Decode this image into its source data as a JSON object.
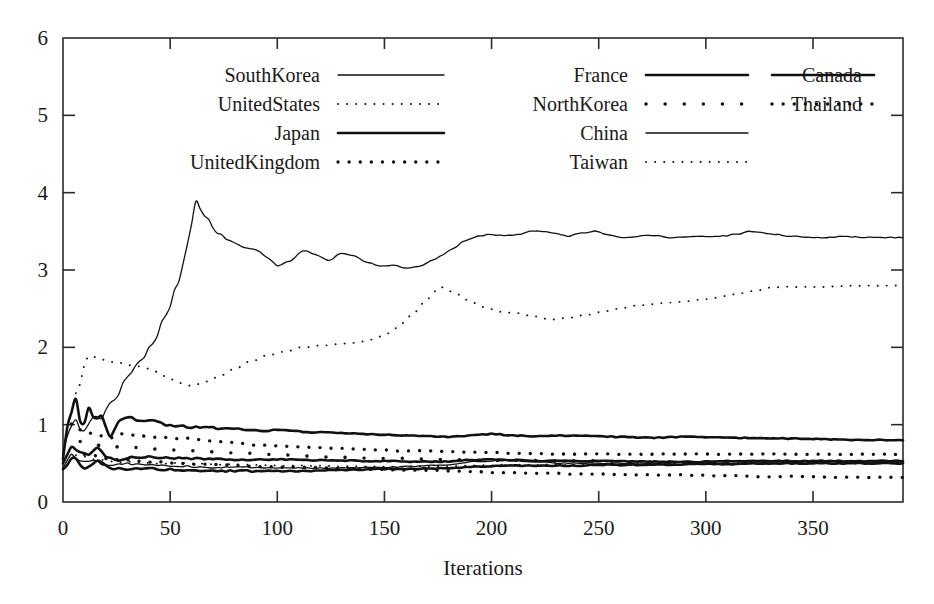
{
  "chart_data": {
    "type": "line",
    "title": "",
    "xlabel": "Iterations",
    "ylabel": "",
    "xlim": [
      0,
      392
    ],
    "ylim": [
      0,
      6
    ],
    "xticks": [
      0,
      50,
      100,
      150,
      200,
      250,
      300,
      350
    ],
    "yticks": [
      0,
      1,
      2,
      3,
      4,
      5,
      6
    ],
    "grid": false,
    "legend_position": "top-inside",
    "legend_columns": 3,
    "series": [
      {
        "name": "SouthKorea",
        "style": "solid-thin",
        "x": [
          0,
          3,
          6,
          9,
          12,
          15,
          18,
          21,
          24,
          30,
          36,
          42,
          48,
          54,
          58,
          62,
          66,
          72,
          78,
          84,
          90,
          96,
          100,
          106,
          112,
          118,
          124,
          130,
          136,
          142,
          148,
          154,
          160,
          166,
          172,
          176,
          182,
          188,
          194,
          200,
          206,
          212,
          218,
          224,
          230,
          236,
          242,
          248,
          254,
          260,
          266,
          272,
          278,
          284,
          290,
          296,
          302,
          308,
          314,
          320,
          326,
          332,
          338,
          344,
          350,
          356,
          362,
          368,
          374,
          380,
          386,
          392
        ],
        "values": [
          0.62,
          0.95,
          1.05,
          0.88,
          1.02,
          1.12,
          1.08,
          1.25,
          1.32,
          1.62,
          1.82,
          2.05,
          2.42,
          2.85,
          3.32,
          3.88,
          3.7,
          3.48,
          3.38,
          3.3,
          3.26,
          3.15,
          3.06,
          3.12,
          3.25,
          3.2,
          3.12,
          3.22,
          3.18,
          3.1,
          3.05,
          3.06,
          3.02,
          3.04,
          3.12,
          3.18,
          3.28,
          3.38,
          3.44,
          3.46,
          3.44,
          3.46,
          3.5,
          3.5,
          3.47,
          3.44,
          3.48,
          3.5,
          3.46,
          3.42,
          3.43,
          3.45,
          3.44,
          3.42,
          3.43,
          3.44,
          3.43,
          3.44,
          3.46,
          3.5,
          3.48,
          3.46,
          3.44,
          3.43,
          3.42,
          3.42,
          3.43,
          3.43,
          3.42,
          3.42,
          3.42,
          3.42
        ]
      },
      {
        "name": "UnitedStates",
        "style": "dotted-fine",
        "x": [
          6,
          12,
          18,
          24,
          30,
          36,
          42,
          48,
          54,
          60,
          66,
          72,
          80,
          88,
          96,
          104,
          112,
          120,
          128,
          136,
          144,
          152,
          158,
          164,
          170,
          176,
          182,
          188,
          196,
          204,
          212,
          220,
          228,
          236,
          244,
          252,
          260,
          268,
          276,
          284,
          292,
          300,
          308,
          316,
          324,
          332,
          340,
          348,
          356,
          364,
          372,
          380,
          388,
          392
        ],
        "values": [
          1.42,
          1.88,
          1.85,
          1.8,
          1.78,
          1.75,
          1.7,
          1.62,
          1.55,
          1.5,
          1.55,
          1.62,
          1.72,
          1.82,
          1.9,
          1.95,
          2.0,
          2.02,
          2.04,
          2.06,
          2.1,
          2.18,
          2.3,
          2.45,
          2.62,
          2.78,
          2.72,
          2.62,
          2.52,
          2.46,
          2.44,
          2.4,
          2.36,
          2.38,
          2.42,
          2.46,
          2.5,
          2.54,
          2.56,
          2.58,
          2.6,
          2.62,
          2.66,
          2.7,
          2.74,
          2.78,
          2.78,
          2.78,
          2.78,
          2.79,
          2.8,
          2.8,
          2.8,
          2.8
        ]
      },
      {
        "name": "Japan",
        "style": "solid-thick",
        "x": [
          0,
          3,
          6,
          9,
          12,
          15,
          18,
          22,
          26,
          30,
          36,
          42,
          48,
          54,
          60,
          68,
          76,
          84,
          92,
          100,
          108,
          116,
          124,
          132,
          140,
          150,
          160,
          170,
          180,
          190,
          200,
          210,
          220,
          230,
          240,
          250,
          262,
          274,
          286,
          298,
          310,
          322,
          334,
          346,
          358,
          370,
          382,
          392
        ],
        "values": [
          0.55,
          1.12,
          1.35,
          0.95,
          1.2,
          1.06,
          1.12,
          0.85,
          1.05,
          1.1,
          1.04,
          1.06,
          1.0,
          0.98,
          0.97,
          0.96,
          0.95,
          0.94,
          0.92,
          0.93,
          0.92,
          0.9,
          0.9,
          0.89,
          0.88,
          0.87,
          0.86,
          0.85,
          0.84,
          0.86,
          0.88,
          0.86,
          0.85,
          0.86,
          0.86,
          0.85,
          0.84,
          0.83,
          0.84,
          0.84,
          0.83,
          0.83,
          0.82,
          0.82,
          0.81,
          0.8,
          0.8,
          0.8
        ]
      },
      {
        "name": "UnitedKingdom",
        "style": "dotted-bold",
        "x": [
          4,
          10,
          16,
          22,
          28,
          34,
          42,
          50,
          58,
          66,
          74,
          82,
          90,
          98,
          106,
          114,
          122,
          130,
          140,
          150,
          160,
          170,
          180,
          190,
          200,
          210,
          220,
          230,
          240,
          252,
          264,
          276,
          288,
          300,
          312,
          324,
          336,
          348,
          360,
          372,
          384,
          392
        ],
        "values": [
          1.02,
          0.92,
          0.86,
          0.84,
          0.88,
          0.86,
          0.84,
          0.83,
          0.82,
          0.8,
          0.78,
          0.76,
          0.74,
          0.73,
          0.72,
          0.71,
          0.7,
          0.69,
          0.68,
          0.67,
          0.66,
          0.66,
          0.65,
          0.64,
          0.64,
          0.63,
          0.63,
          0.62,
          0.62,
          0.62,
          0.62,
          0.62,
          0.62,
          0.62,
          0.62,
          0.62,
          0.62,
          0.62,
          0.62,
          0.62,
          0.62,
          0.62
        ]
      },
      {
        "name": "France",
        "style": "solid-thick",
        "x": [
          0,
          4,
          8,
          12,
          16,
          20,
          26,
          32,
          40,
          50,
          60,
          70,
          80,
          92,
          104,
          116,
          128,
          140,
          152,
          164,
          176,
          188,
          200,
          212,
          224,
          236,
          248,
          260,
          272,
          284,
          296,
          308,
          320,
          332,
          344,
          356,
          368,
          380,
          392
        ],
        "values": [
          0.5,
          0.72,
          0.66,
          0.62,
          0.7,
          0.6,
          0.55,
          0.58,
          0.58,
          0.57,
          0.56,
          0.56,
          0.55,
          0.55,
          0.55,
          0.54,
          0.54,
          0.53,
          0.53,
          0.52,
          0.52,
          0.54,
          0.55,
          0.54,
          0.53,
          0.53,
          0.53,
          0.53,
          0.52,
          0.52,
          0.52,
          0.53,
          0.53,
          0.53,
          0.53,
          0.53,
          0.53,
          0.53,
          0.53
        ]
      },
      {
        "name": "NorthKorea",
        "style": "dotted-sparse",
        "x": [
          8,
          20,
          34,
          48,
          62,
          78,
          94,
          110,
          126,
          144,
          162,
          180,
          198,
          216,
          234,
          252,
          270,
          288,
          306,
          324,
          342,
          360,
          378,
          392
        ],
        "values": [
          0.78,
          0.72,
          0.7,
          0.68,
          0.66,
          0.64,
          0.62,
          0.6,
          0.58,
          0.57,
          0.56,
          0.55,
          0.54,
          0.54,
          0.53,
          0.53,
          0.52,
          0.52,
          0.52,
          0.52,
          0.52,
          0.52,
          0.52,
          0.52
        ]
      },
      {
        "name": "China",
        "style": "solid-thin",
        "x": [
          0,
          4,
          8,
          14,
          20,
          28,
          36,
          46,
          56,
          68,
          80,
          94,
          108,
          122,
          136,
          150,
          164,
          178,
          192,
          206,
          220,
          234,
          248,
          262,
          276,
          290,
          304,
          318,
          332,
          346,
          360,
          374,
          388,
          392
        ],
        "values": [
          0.45,
          0.62,
          0.52,
          0.55,
          0.48,
          0.5,
          0.48,
          0.47,
          0.46,
          0.45,
          0.45,
          0.44,
          0.44,
          0.44,
          0.44,
          0.45,
          0.46,
          0.48,
          0.52,
          0.54,
          0.52,
          0.5,
          0.5,
          0.5,
          0.5,
          0.51,
          0.52,
          0.52,
          0.52,
          0.52,
          0.52,
          0.52,
          0.52,
          0.52
        ]
      },
      {
        "name": "Taiwan",
        "style": "dotted-fine",
        "x": [
          6,
          16,
          28,
          40,
          54,
          68,
          84,
          100,
          118,
          136,
          154,
          172,
          190,
          208,
          226,
          244,
          262,
          280,
          298,
          316,
          334,
          352,
          370,
          388,
          392
        ],
        "values": [
          0.6,
          0.55,
          0.52,
          0.5,
          0.5,
          0.49,
          0.48,
          0.47,
          0.47,
          0.46,
          0.46,
          0.46,
          0.47,
          0.48,
          0.48,
          0.48,
          0.49,
          0.49,
          0.5,
          0.5,
          0.5,
          0.5,
          0.5,
          0.5,
          0.5
        ]
      },
      {
        "name": "Canada",
        "style": "solid-thick",
        "x": [
          0,
          5,
          10,
          16,
          22,
          30,
          38,
          48,
          58,
          70,
          84,
          98,
          112,
          126,
          140,
          154,
          168,
          182,
          196,
          210,
          224,
          238,
          252,
          266,
          280,
          294,
          308,
          322,
          336,
          350,
          364,
          378,
          392
        ],
        "values": [
          0.42,
          0.58,
          0.45,
          0.52,
          0.44,
          0.42,
          0.44,
          0.42,
          0.41,
          0.4,
          0.4,
          0.4,
          0.4,
          0.41,
          0.42,
          0.43,
          0.43,
          0.44,
          0.46,
          0.47,
          0.47,
          0.47,
          0.48,
          0.48,
          0.48,
          0.49,
          0.49,
          0.5,
          0.5,
          0.5,
          0.5,
          0.5,
          0.5
        ]
      },
      {
        "name": "Thailand",
        "style": "dotted-bold",
        "x": [
          10,
          24,
          40,
          56,
          72,
          90,
          108,
          126,
          146,
          166,
          186,
          206,
          226,
          246,
          266,
          286,
          306,
          326,
          346,
          366,
          386,
          392
        ],
        "values": [
          0.62,
          0.56,
          0.52,
          0.5,
          0.48,
          0.46,
          0.45,
          0.44,
          0.42,
          0.41,
          0.4,
          0.38,
          0.37,
          0.36,
          0.35,
          0.35,
          0.34,
          0.33,
          0.33,
          0.32,
          0.32,
          0.32
        ]
      }
    ]
  },
  "legend": {
    "columns": [
      [
        {
          "label": "SouthKorea",
          "style": "solid-thin"
        },
        {
          "label": "UnitedStates",
          "style": "dotted-fine"
        },
        {
          "label": "Japan",
          "style": "solid-thick"
        },
        {
          "label": "UnitedKingdom",
          "style": "dotted-bold"
        }
      ],
      [
        {
          "label": "France",
          "style": "solid-thick"
        },
        {
          "label": "NorthKorea",
          "style": "dotted-sparse"
        },
        {
          "label": "China",
          "style": "solid-thin"
        },
        {
          "label": "Taiwan",
          "style": "dotted-fine"
        }
      ],
      [
        {
          "label": "Canada",
          "style": "solid-thick"
        },
        {
          "label": "Thailand",
          "style": "dotted-bold"
        }
      ]
    ]
  },
  "colors": {
    "ink": "#111111",
    "frame": "#2b2b2b",
    "background": "#ffffff"
  }
}
